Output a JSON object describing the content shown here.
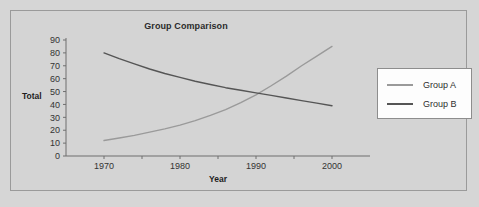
{
  "chart_data": {
    "type": "line",
    "title": "Group Comparison",
    "xlabel": "Year",
    "ylabel": "Total",
    "xlim": [
      1965,
      2005
    ],
    "ylim": [
      0,
      90
    ],
    "xticks": [
      "1970",
      "1980",
      "1990",
      "2000"
    ],
    "xtick_values": [
      1970,
      1980,
      1990,
      2000
    ],
    "yticks": [
      "0",
      "10",
      "20",
      "30",
      "40",
      "50",
      "60",
      "70",
      "80",
      "90"
    ],
    "ytick_values": [
      0,
      10,
      20,
      30,
      40,
      50,
      60,
      70,
      80,
      90
    ],
    "grid": false,
    "legend_position": "right",
    "x": [
      1970,
      1972,
      1974,
      1976,
      1978,
      1980,
      1982,
      1984,
      1986,
      1988,
      1990,
      1992,
      1994,
      1996,
      1998,
      2000
    ],
    "series": [
      {
        "name": "Group A",
        "color": "#9a9a9a",
        "values": [
          12,
          14,
          16,
          18.5,
          21,
          24,
          27.5,
          31.5,
          36,
          41.5,
          47.5,
          54.5,
          62,
          70,
          77.5,
          85
        ]
      },
      {
        "name": "Group B",
        "color": "#555555",
        "values": [
          80,
          75.5,
          71.5,
          67.5,
          64,
          61,
          58,
          55.5,
          53,
          51,
          49,
          47,
          45,
          43,
          41,
          39
        ]
      }
    ],
    "crossover": {
      "year": 1989,
      "value": 46
    }
  },
  "legend": {
    "entries": [
      {
        "label": "Group A",
        "color": "#9a9a9a"
      },
      {
        "label": "Group B",
        "color": "#555555"
      }
    ]
  },
  "colors": {
    "background": "#d6d6d6",
    "panel": "#d4d4d4",
    "panel_border": "#9a9a9a",
    "axis": "#6f6f6f",
    "text": "#2b2b2b",
    "legend_background": "#fdfdfd",
    "legend_border": "#8d8d8d",
    "group_a": "#9a9a9a",
    "group_b": "#555555"
  }
}
